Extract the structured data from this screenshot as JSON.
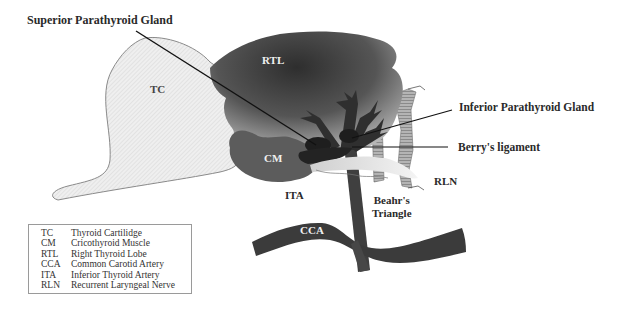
{
  "diagram": {
    "type": "anatomical-schematic",
    "callouts": {
      "superior_parathyroid": "Superior Parathyroid Gland",
      "inferior_parathyroid": "Inferior Parathyroid Gland",
      "berrys_ligament": "Berry's ligament"
    },
    "structure_labels": {
      "tc": "TC",
      "rtl": "RTL",
      "cm": "CM",
      "ita": "ITA",
      "rln": "RLN",
      "cca": "CCA",
      "beahr_line1": "Beahr's",
      "beahr_line2": "Triangle"
    },
    "colors": {
      "thyroid_cartilage": "#ededed",
      "thyroid_lobe_dark": "#3c3c3c",
      "thyroid_lobe_light": "#a8a8a8",
      "cricothyroid": "#5a5a5a",
      "artery": "#3e3e3e",
      "nerve": "#d8d8d8",
      "trachea_stripe": "#9c9c9c"
    }
  },
  "legend": {
    "items": [
      {
        "abbr": "TC",
        "name": "Thyroid Cartilidge"
      },
      {
        "abbr": "CM",
        "name": "Cricothyroid Muscle"
      },
      {
        "abbr": "RTL",
        "name": "Right Thyroid Lobe"
      },
      {
        "abbr": "CCA",
        "name": "Common Carotid Artery"
      },
      {
        "abbr": "ITA",
        "name": "Inferior Thyroid Artery"
      },
      {
        "abbr": "RLN",
        "name": "Recurrent Laryngeal Nerve"
      }
    ]
  }
}
